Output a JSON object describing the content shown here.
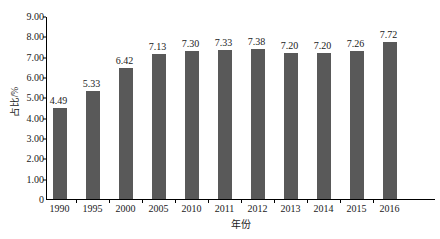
{
  "chart_data": {
    "type": "bar",
    "title": "",
    "subtitle": "",
    "xlabel": "年份",
    "ylabel": "占比/%",
    "categories": [
      "1990",
      "1995",
      "2000",
      "2005",
      "2010",
      "2011",
      "2012",
      "2013",
      "2014",
      "2015",
      "2016"
    ],
    "values": [
      4.49,
      5.33,
      6.42,
      7.13,
      7.3,
      7.33,
      7.38,
      7.2,
      7.2,
      7.26,
      7.72
    ],
    "data_labels": [
      "4.49",
      "5.33",
      "6.42",
      "7.13",
      "7.30",
      "7.33",
      "7.38",
      "7.20",
      "7.20",
      "7.26",
      "7.72"
    ],
    "series": [
      {
        "name": "占比",
        "values": [
          4.49,
          5.33,
          6.42,
          7.13,
          7.3,
          7.33,
          7.38,
          7.2,
          7.2,
          7.26,
          7.72
        ],
        "color": "#595959"
      }
    ],
    "ylim": [
      0,
      9
    ],
    "ytick_step": 1,
    "ytick_labels": [
      "9.00",
      "8.00",
      "7.00",
      "6.00",
      "5.00",
      "4.00",
      "3.00",
      "2.00",
      "1.00",
      "0"
    ],
    "ytick_values": [
      9,
      8,
      7,
      6,
      5,
      4,
      3,
      2,
      1,
      0
    ],
    "grid": false,
    "legend": false,
    "legend_position": "none",
    "axis_color": "#000000",
    "background": "#ffffff",
    "text_color": "#1a1a1a"
  }
}
